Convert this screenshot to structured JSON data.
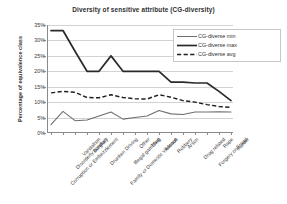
{
  "chart_data": {
    "type": "line",
    "title": "Diversity of sensitive attribute (CG-diversity)",
    "xlabel": "",
    "ylabel": "Percentage of equivalence class",
    "ylim": [
      0,
      35
    ],
    "ytick_step": 5,
    "ytick_labels": [
      "0%",
      "5%",
      "10%",
      "15%",
      "20%",
      "25%",
      "30%",
      "35%"
    ],
    "ytick_values": [
      0,
      5,
      10,
      15,
      20,
      25,
      30,
      35
    ],
    "grid": true,
    "legend_position": "top-right",
    "categories": [
      "Corruption or Embezzlement",
      "Disorderly conduct",
      "Vandalism",
      "Burglary",
      "Drunken Driving",
      "Family or Domestic Violence",
      "Illegal gambling",
      "Other",
      "Theft",
      "Assault",
      "Robbery",
      "Arson",
      "Drug related",
      "Forgery or Fraud",
      "Rape",
      "Murder"
    ],
    "series": [
      {
        "name": "CG-diverse min",
        "style": "solid-thin",
        "color": "#6e6e6e",
        "values": [
          2.7,
          7.0,
          4.0,
          4.2,
          5.5,
          6.8,
          4.5,
          5.0,
          5.5,
          7.3,
          6.2,
          6.0,
          6.8,
          6.8,
          6.9,
          6.8
        ]
      },
      {
        "name": "CG-diverse max",
        "style": "solid-thick",
        "color": "#2a2a2a",
        "values": [
          33.2,
          33.2,
          26.5,
          20.0,
          20.0,
          25.0,
          20.0,
          20.0,
          20.0,
          20.0,
          16.5,
          16.5,
          16.2,
          16.2,
          13.5,
          10.5
        ]
      },
      {
        "name": "CG-diverse avg",
        "style": "dashed",
        "color": "#1f1f1f",
        "values": [
          13.0,
          13.5,
          13.2,
          11.5,
          11.4,
          12.4,
          11.5,
          11.1,
          11.0,
          12.4,
          11.6,
          10.5,
          10.0,
          9.2,
          8.6,
          8.3
        ]
      }
    ]
  }
}
